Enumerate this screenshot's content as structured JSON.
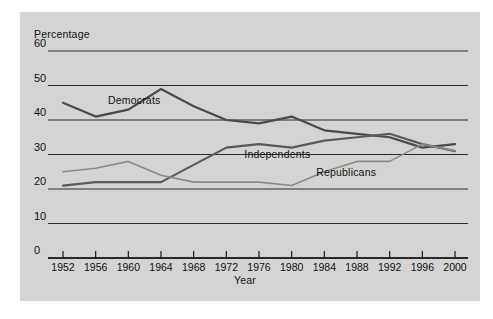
{
  "figure": {
    "background_color": "#ffffff",
    "panel_color": "#d4d4d4"
  },
  "chart_data": {
    "type": "line",
    "title": "",
    "subtitle": "",
    "xlabel": "Year",
    "ylabel": "Percentage",
    "grid": true,
    "grid_orientation": "horizontal",
    "legend_position": "inline-annotation",
    "xlim": [
      1950,
      2002
    ],
    "ylim": [
      0,
      62
    ],
    "yticks": [
      0,
      10,
      20,
      30,
      40,
      50,
      60
    ],
    "ytick_labels": [
      "0",
      "10",
      "20",
      "30",
      "40",
      "50",
      "60"
    ],
    "x": [
      1952,
      1956,
      1960,
      1964,
      1968,
      1972,
      1976,
      1980,
      1984,
      1988,
      1992,
      1996,
      2000
    ],
    "xtick_labels": [
      "1952",
      "1956",
      "1960",
      "1964",
      "1968",
      "1972",
      "1976",
      "1980",
      "1984",
      "1988",
      "1992",
      "1996",
      "2000"
    ],
    "series": [
      {
        "name": "Democrats",
        "color": "#4a4a4a",
        "width": 2.2,
        "values": [
          45,
          41,
          43,
          49,
          44,
          40,
          39,
          41,
          37,
          36,
          35,
          32,
          33
        ],
        "label_x": 1957.5,
        "label_y": 45.5
      },
      {
        "name": "Independents",
        "color": "#5a5a5a",
        "width": 2.2,
        "values": [
          21,
          22,
          22,
          22,
          27,
          32,
          33,
          32,
          34,
          35,
          36,
          33,
          31
        ],
        "label_x": 1974.2,
        "label_y": 29.8
      },
      {
        "name": "Republicans",
        "color": "#8a8a8a",
        "width": 1.6,
        "values": [
          25,
          26,
          28,
          24,
          22,
          22,
          22,
          21,
          25,
          28,
          28,
          33,
          31
        ],
        "label_x": 1983.0,
        "label_y": 24.5
      }
    ]
  }
}
